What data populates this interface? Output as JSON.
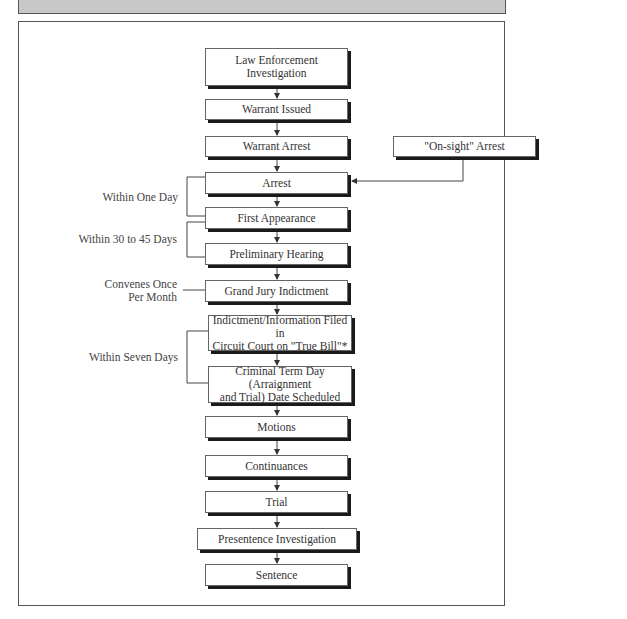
{
  "diagram": {
    "type": "flowchart",
    "title": "",
    "nodes": [
      {
        "id": "law_enforcement",
        "label": "Law Enforcement Investigation",
        "line1": "Law Enforcement",
        "line2": "Investigation"
      },
      {
        "id": "warrant_issued",
        "label": "Warrant Issued"
      },
      {
        "id": "warrant_arrest",
        "label": "Warrant Arrest"
      },
      {
        "id": "onsight_arrest",
        "label": "\"On-sight\" Arrest"
      },
      {
        "id": "arrest",
        "label": "Arrest"
      },
      {
        "id": "first_appearance",
        "label": "First Appearance"
      },
      {
        "id": "preliminary_hearing",
        "label": "Preliminary Hearing"
      },
      {
        "id": "grand_jury",
        "label": "Grand Jury Indictment"
      },
      {
        "id": "indictment_filed",
        "label": "Indictment/Information Filed in Circuit Court on \"True Bill\"*",
        "line1": "Indictment/Information Filed in",
        "line2": "Circuit Court on \"True Bill\"*"
      },
      {
        "id": "criminal_term",
        "label": "Criminal Term Day (Arraignment and Trial) Date Scheduled",
        "line1": "Criminal Term Day (Arraignment",
        "line2": "and Trial) Date Scheduled"
      },
      {
        "id": "motions",
        "label": "Motions"
      },
      {
        "id": "continuances",
        "label": "Continuances"
      },
      {
        "id": "trial",
        "label": "Trial"
      },
      {
        "id": "presentence",
        "label": "Presentence Investigation"
      },
      {
        "id": "sentence",
        "label": "Sentence"
      }
    ],
    "edges": [
      [
        "law_enforcement",
        "warrant_issued"
      ],
      [
        "warrant_issued",
        "warrant_arrest"
      ],
      [
        "warrant_arrest",
        "arrest"
      ],
      [
        "onsight_arrest",
        "arrest"
      ],
      [
        "arrest",
        "first_appearance"
      ],
      [
        "first_appearance",
        "preliminary_hearing"
      ],
      [
        "preliminary_hearing",
        "grand_jury"
      ],
      [
        "grand_jury",
        "indictment_filed"
      ],
      [
        "indictment_filed",
        "criminal_term"
      ],
      [
        "criminal_term",
        "motions"
      ],
      [
        "motions",
        "continuances"
      ],
      [
        "continuances",
        "trial"
      ],
      [
        "trial",
        "presentence"
      ],
      [
        "presentence",
        "sentence"
      ]
    ],
    "annotations": [
      {
        "id": "within_one_day",
        "text": "Within One Day",
        "spans": [
          "arrest",
          "first_appearance"
        ]
      },
      {
        "id": "within_30_45",
        "text": "Within 30 to 45 Days",
        "spans": [
          "first_appearance",
          "preliminary_hearing"
        ]
      },
      {
        "id": "convenes",
        "text": "Convenes Once Per Month",
        "line1": "Convenes Once",
        "line2": "Per Month",
        "attached": "grand_jury"
      },
      {
        "id": "within_seven",
        "text": "Within Seven Days",
        "spans": [
          "indictment_filed",
          "criminal_term"
        ]
      }
    ]
  },
  "colors": {
    "header_bar": "#c8c8c8",
    "box_border": "#666666",
    "box_shadow": "#1a1a1a",
    "text": "#333333"
  }
}
